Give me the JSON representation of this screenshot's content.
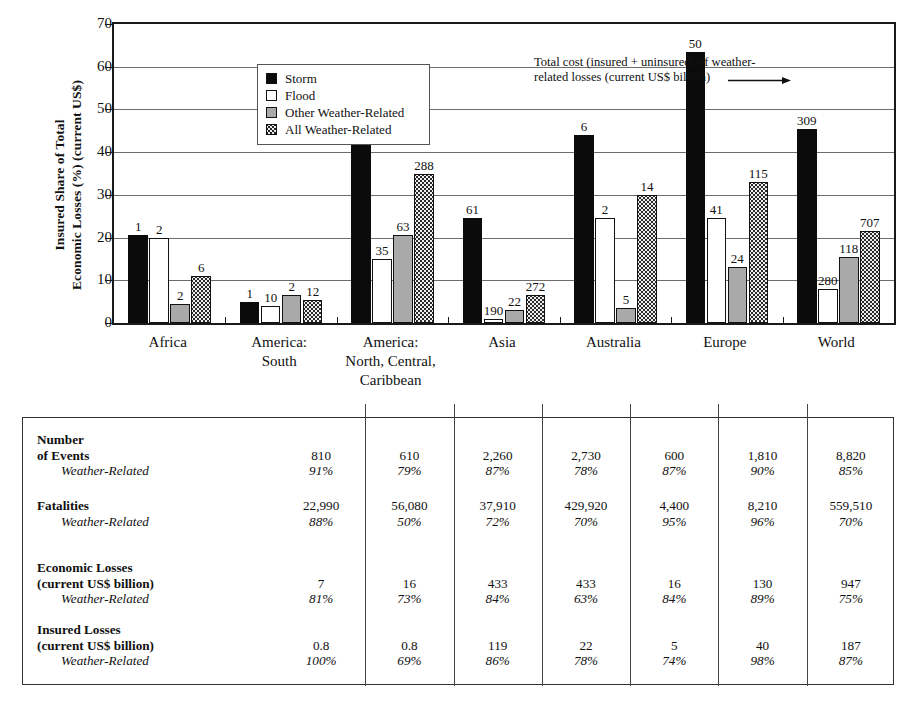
{
  "chart_data": {
    "type": "bar",
    "title": "",
    "xlabel": "",
    "ylabel_lines": [
      "Insured Share of Total",
      "Economic Losses (%) (current US$)"
    ],
    "ylim": [
      0,
      70
    ],
    "yticks": [
      0,
      10,
      20,
      30,
      40,
      50,
      60,
      70
    ],
    "grid": true,
    "legend_position": "upper-left-inside",
    "categories": [
      "Africa",
      "America: South",
      "America: North, Central, Caribbean",
      "Asia",
      "Australia",
      "Europe",
      "World"
    ],
    "category_label_lines": [
      [
        "Africa"
      ],
      [
        "America:",
        "South"
      ],
      [
        "America:",
        "North, Central,",
        "Caribbean"
      ],
      [
        "Asia"
      ],
      [
        "Australia"
      ],
      [
        "Europe"
      ],
      [
        "World"
      ]
    ],
    "series": [
      {
        "name": "Storm",
        "fill": "black",
        "values": [
          20.5,
          5.0,
          46.0,
          24.5,
          44.0,
          63.5,
          45.5
        ],
        "labels": [
          "1",
          "1",
          "190",
          "61",
          "6",
          "50",
          "309"
        ]
      },
      {
        "name": "Flood",
        "fill": "white",
        "values": [
          20.0,
          4.0,
          15.0,
          1.0,
          24.5,
          24.5,
          8.0
        ],
        "labels": [
          "2",
          "10",
          "35",
          "190",
          "2",
          "41",
          "280"
        ]
      },
      {
        "name": "Other Weather-Related",
        "fill": "gray",
        "values": [
          4.5,
          6.5,
          20.5,
          3.0,
          3.5,
          13.0,
          15.5
        ],
        "labels": [
          "2",
          "2",
          "63",
          "22",
          "5",
          "24",
          "118"
        ]
      },
      {
        "name": "All Weather-Related",
        "fill": "speckled",
        "values": [
          11.0,
          5.5,
          35.0,
          6.5,
          30.0,
          33.0,
          21.5
        ],
        "labels": [
          "6",
          "12",
          "288",
          "272",
          "14",
          "115",
          "707"
        ]
      }
    ],
    "annotation": {
      "line1": "Total cost (insured + uninsured) of weather-",
      "line2": "related losses (current US$ billion)",
      "points_to": "50"
    }
  },
  "legend": {
    "items": [
      {
        "label": "Storm"
      },
      {
        "label": "Flood"
      },
      {
        "label": "Other Weather-Related"
      },
      {
        "label": "All Weather-Related"
      }
    ]
  },
  "table": {
    "columns": [
      "Africa",
      "America: South",
      "America: North, Central, Caribbean",
      "Asia",
      "Australia",
      "Europe",
      "World"
    ],
    "row_groups": [
      {
        "label_line1": "Number",
        "label_line2": "of Events",
        "sub_label": "Weather-Related",
        "values": [
          "810",
          "610",
          "2,260",
          "2,730",
          "600",
          "1,810",
          "8,820"
        ],
        "percents": [
          "91%",
          "79%",
          "87%",
          "78%",
          "87%",
          "90%",
          "85%"
        ]
      },
      {
        "label_line1": "Fatalities",
        "label_line2": "",
        "sub_label": "Weather-Related",
        "values": [
          "22,990",
          "56,080",
          "37,910",
          "429,920",
          "4,400",
          "8,210",
          "559,510"
        ],
        "percents": [
          "88%",
          "50%",
          "72%",
          "70%",
          "95%",
          "96%",
          "70%"
        ]
      },
      {
        "label_line1": "Economic Losses",
        "label_line2": "(current US$ billion)",
        "sub_label": "Weather-Related",
        "values": [
          "7",
          "16",
          "433",
          "433",
          "16",
          "130",
          "947"
        ],
        "percents": [
          "81%",
          "73%",
          "84%",
          "63%",
          "84%",
          "89%",
          "75%"
        ]
      },
      {
        "label_line1": "Insured Losses",
        "label_line2": "(current US$ billion)",
        "sub_label": "Weather-Related",
        "values": [
          "0.8",
          "0.8",
          "119",
          "22",
          "5",
          "40",
          "187"
        ],
        "percents": [
          "100%",
          "69%",
          "86%",
          "78%",
          "74%",
          "98%",
          "87%"
        ]
      }
    ]
  },
  "colors": {
    "storm": "#0b0b0b",
    "flood": "#ffffff",
    "other": "#a9a9a9",
    "all": "#e8e8e8",
    "axis": "#1a1a1a",
    "grid": "#6d6d6d"
  }
}
